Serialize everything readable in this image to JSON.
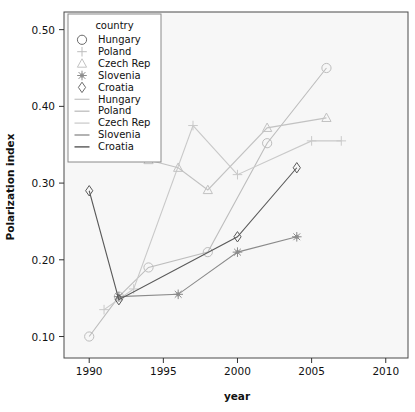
{
  "chart_data": {
    "type": "line",
    "title": "",
    "xlabel": "year",
    "ylabel": "Polarization index",
    "xlim": [
      1988.3,
      2011.5
    ],
    "ylim": [
      0.072,
      0.523
    ],
    "xticks": [
      1990,
      1995,
      2000,
      2005,
      2010
    ],
    "xticklabels": [
      "1990",
      "1995",
      "2000",
      "2005",
      "2010"
    ],
    "yticks": [
      0.1,
      0.2,
      0.3,
      0.4,
      0.5
    ],
    "yticklabels": [
      "0.10",
      "0.20",
      "0.30",
      "0.40",
      "0.50"
    ],
    "grid": false,
    "legend_position": "top-left-inside",
    "legend_title": "country",
    "series": [
      {
        "name": "Hungary",
        "marker": "circle",
        "color": "#bdbdbd",
        "x": [
          1990,
          1992,
          1994,
          1998,
          2002,
          2006
        ],
        "y": [
          0.1,
          0.152,
          0.19,
          0.21,
          0.352,
          0.45
        ]
      },
      {
        "name": "Poland",
        "marker": "plus",
        "color": "#c9c9c9",
        "x": [
          1991,
          1993,
          1997,
          2000,
          2005,
          2007
        ],
        "y": [
          0.135,
          0.162,
          0.375,
          0.311,
          0.355,
          0.355
        ]
      },
      {
        "name": "Czech Rep",
        "marker": "triangle",
        "color": "#c2c2c2",
        "x": [
          1994,
          1996,
          1998,
          2002,
          2006
        ],
        "y": [
          0.33,
          0.32,
          0.291,
          0.372,
          0.385
        ]
      },
      {
        "name": "Slovenia",
        "marker": "asterisk",
        "color": "#8a8a8a",
        "x": [
          1992,
          1996,
          2000,
          2004
        ],
        "y": [
          0.152,
          0.155,
          0.21,
          0.23
        ]
      },
      {
        "name": "Croatia",
        "marker": "diamond",
        "color": "#5a5a5a",
        "x": [
          1990,
          1992,
          2000,
          2004
        ],
        "y": [
          0.29,
          0.148,
          0.23,
          0.32
        ]
      }
    ],
    "legend_entries": [
      {
        "label": "Hungary",
        "kind": "marker",
        "marker": "circle",
        "color": "#6b6b6b"
      },
      {
        "label": "Poland",
        "kind": "marker",
        "marker": "plus",
        "color": "#bdbdbd"
      },
      {
        "label": "Czech Rep",
        "kind": "marker",
        "marker": "triangle",
        "color": "#c2c2c2"
      },
      {
        "label": "Slovenia",
        "kind": "marker",
        "marker": "asterisk",
        "color": "#8a8a8a"
      },
      {
        "label": "Croatia",
        "kind": "marker",
        "marker": "diamond",
        "color": "#6b6b6b"
      },
      {
        "label": "Hungary",
        "kind": "line",
        "color": "#c8c8c8"
      },
      {
        "label": "Poland",
        "kind": "line",
        "color": "#bdbdbd"
      },
      {
        "label": "Czech Rep",
        "kind": "line",
        "color": "#cccccc"
      },
      {
        "label": "Slovenia",
        "kind": "line",
        "color": "#8a8a8a"
      },
      {
        "label": "Croatia",
        "kind": "line",
        "color": "#4a4a4a"
      }
    ]
  }
}
